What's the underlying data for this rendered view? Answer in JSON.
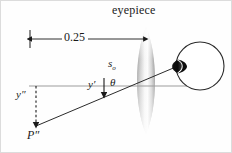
{
  "figure": {
    "title_label": "eyepiece",
    "dimension_label": "0.25",
    "labels": {
      "object_distance": "s",
      "object_distance_sub": "o",
      "image_height_prime": "y′",
      "angle": "θ",
      "image_height_double_prime": "y″",
      "image_point": "P″"
    },
    "colors": {
      "ink": "#1a1a1a",
      "axis_gray": "#999999",
      "lens_dark": "#8d8d8d",
      "lens_light": "#f2f2f2",
      "eye_outline": "#2b2b2b",
      "cornea_fill": "#0d0d0d",
      "background": "#fefefe",
      "border": "#d8d8d8"
    },
    "geometry": {
      "axis_y": 86,
      "axis_x_start": 29,
      "axis_x_end": 190,
      "lens_center_x": 146,
      "lens_top_y": 27,
      "lens_bottom_y": 134,
      "lens_half_width": 12,
      "dim_line_y": 39,
      "dim_x_left": 30,
      "dim_x_right": 143,
      "tick_x": 30,
      "tick_y_top": 30,
      "tick_y_bottom": 48,
      "ray_x1": 36,
      "ray_y1": 126,
      "ray_x2": 188,
      "ray_y2": 62,
      "dashed_x": 36,
      "dashed_y_top": 86,
      "dashed_y_bottom": 124,
      "yprime_arrow_x": 104,
      "yprime_arrow_y_top": 78,
      "yprime_arrow_y_bottom": 93,
      "eye_cx": 200,
      "eye_cy": 66,
      "eye_r": 24
    }
  }
}
